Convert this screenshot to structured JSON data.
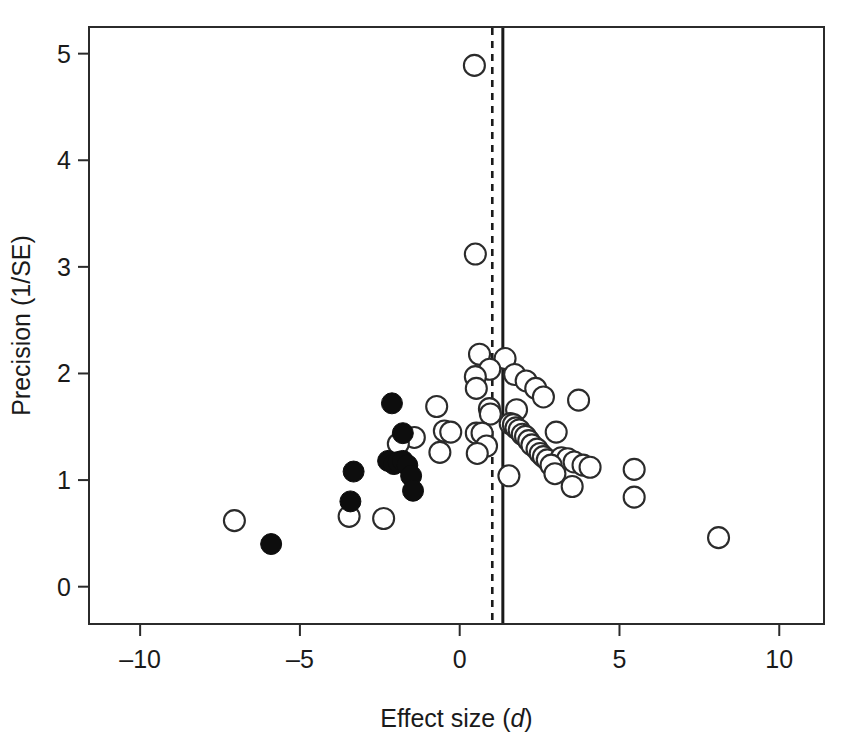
{
  "chart_data": {
    "type": "scatter",
    "title": "",
    "subtitle": "",
    "xlabel": "Effect size (d)",
    "xlabel_plain": "Effect size",
    "xlabel_italic_symbol": "d",
    "ylabel": "Precision (1/SE)",
    "xlim": [
      -11.6,
      11.4
    ],
    "ylim": [
      -0.35,
      5.25
    ],
    "xticks": [
      -10,
      -5,
      0,
      5,
      10
    ],
    "xtick_labels": [
      "–10",
      "–5",
      "0",
      "5",
      "10"
    ],
    "yticks": [
      0,
      1,
      2,
      3,
      4,
      5
    ],
    "ytick_labels": [
      "0",
      "1",
      "2",
      "3",
      "4",
      "5"
    ],
    "grid": false,
    "legend_position": "none",
    "annotations": [
      {
        "name": "pooled-effect-line",
        "type": "vline-solid",
        "x": 1.35,
        "label": ""
      },
      {
        "name": "adjusted-effect-line",
        "type": "vline-dashed",
        "x": 1.02,
        "label": ""
      }
    ],
    "series": [
      {
        "name": "open-circles",
        "marker": "open-circle",
        "marker_color": "#ffffff",
        "marker_edge_color": "#2b2b2b",
        "points": [
          [
            0.46,
            4.89
          ],
          [
            0.49,
            3.12
          ],
          [
            0.62,
            2.18
          ],
          [
            1.42,
            2.14
          ],
          [
            0.94,
            2.04
          ],
          [
            0.49,
            1.97
          ],
          [
            1.72,
            1.99
          ],
          [
            2.08,
            1.93
          ],
          [
            0.52,
            1.86
          ],
          [
            2.38,
            1.86
          ],
          [
            2.62,
            1.78
          ],
          [
            -0.72,
            1.69
          ],
          [
            0.93,
            1.67
          ],
          [
            1.78,
            1.66
          ],
          [
            3.72,
            1.75
          ],
          [
            0.96,
            1.62
          ],
          [
            1.58,
            1.53
          ],
          [
            1.68,
            1.52
          ],
          [
            1.76,
            1.49
          ],
          [
            1.86,
            1.47
          ],
          [
            -0.48,
            1.46
          ],
          [
            -0.28,
            1.45
          ],
          [
            0.52,
            1.44
          ],
          [
            0.7,
            1.44
          ],
          [
            -1.42,
            1.4
          ],
          [
            1.96,
            1.43
          ],
          [
            2.06,
            1.41
          ],
          [
            3.02,
            1.45
          ],
          [
            2.16,
            1.37
          ],
          [
            2.26,
            1.33
          ],
          [
            0.84,
            1.32
          ],
          [
            2.42,
            1.29
          ],
          [
            2.52,
            1.25
          ],
          [
            -0.62,
            1.26
          ],
          [
            0.55,
            1.25
          ],
          [
            2.62,
            1.22
          ],
          [
            2.74,
            1.19
          ],
          [
            3.18,
            1.21
          ],
          [
            3.38,
            1.2
          ],
          [
            3.58,
            1.17
          ],
          [
            2.86,
            1.14
          ],
          [
            3.86,
            1.14
          ],
          [
            4.08,
            1.12
          ],
          [
            5.46,
            1.1
          ],
          [
            1.54,
            1.04
          ],
          [
            2.98,
            1.06
          ],
          [
            3.52,
            0.94
          ],
          [
            -3.46,
            0.66
          ],
          [
            -1.92,
            1.34
          ],
          [
            5.46,
            0.84
          ],
          [
            -7.05,
            0.62
          ],
          [
            -2.38,
            0.64
          ],
          [
            8.1,
            0.46
          ]
        ]
      },
      {
        "name": "filled-circles",
        "marker": "filled-circle",
        "marker_color": "#0d0d0d",
        "marker_edge_color": "#0d0d0d",
        "points": [
          [
            -2.12,
            1.72
          ],
          [
            -1.78,
            1.44
          ],
          [
            -3.32,
            1.08
          ],
          [
            -2.24,
            1.18
          ],
          [
            -2.06,
            1.15
          ],
          [
            -1.92,
            1.17
          ],
          [
            -1.78,
            1.18
          ],
          [
            -1.64,
            1.14
          ],
          [
            -1.52,
            1.04
          ],
          [
            -1.46,
            0.9
          ],
          [
            -3.42,
            0.8
          ],
          [
            -5.9,
            0.4
          ]
        ]
      }
    ]
  }
}
